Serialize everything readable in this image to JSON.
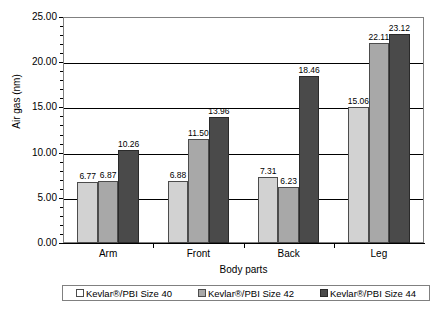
{
  "chart_data": {
    "type": "bar",
    "title": "",
    "xlabel": "Body parts",
    "ylabel": "Air gas (nm)",
    "ylim": [
      0,
      25
    ],
    "ytick_labels": [
      "25.00",
      "20.00",
      "15.00",
      "10.00",
      "5.00",
      "0.00"
    ],
    "yticks": [
      25,
      20,
      15,
      10,
      5,
      0
    ],
    "grid": true,
    "legend_position": "bottom",
    "categories": [
      "Arm",
      "Front",
      "Back",
      "Leg"
    ],
    "series": [
      {
        "name": "Kevlar®/PBI Size 40",
        "color": "#d2d2d2",
        "values": [
          6.77,
          6.88,
          7.31,
          15.06
        ],
        "labels": [
          "6.77",
          "6.88",
          "7.31",
          "15.06"
        ]
      },
      {
        "name": "Kevlar®/PBI Size 42",
        "color": "#a8a8a8",
        "values": [
          6.87,
          11.5,
          6.23,
          22.11
        ],
        "labels": [
          "6.87",
          "11.50",
          "6.23",
          "22.11"
        ]
      },
      {
        "name": "Kevlar®/PBI Size 44",
        "color": "#4a4a4a",
        "values": [
          10.26,
          13.96,
          18.46,
          23.12
        ],
        "labels": [
          "10.26",
          "13.96",
          "18.46",
          "23.12"
        ]
      }
    ]
  }
}
